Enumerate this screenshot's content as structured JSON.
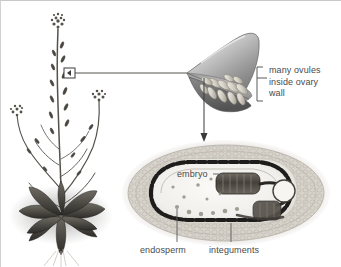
{
  "figure": {
    "background_color": "#ffffff",
    "text_color": "#4a4a4a",
    "border_color": "#c8c8c8"
  },
  "labels": {
    "many_ovules": "many ovules",
    "inside_ovary": "inside ovary",
    "wall": "wall",
    "embryo": "embryo",
    "endosperm": "endosperm",
    "integuments": "integuments"
  },
  "parts": {
    "plant": "arabidopsis-plant-photo",
    "callout_box": "stem-magnification-box",
    "connector_line": "callout-connector-line",
    "ovary": "ovary-cutaway-illustration",
    "ovules": "ovules-inside-ovary",
    "bracket": "ovule-label-bracket",
    "arrow": "ovary-to-seed-arrow",
    "seed": "seed-cross-section-micrograph",
    "embryo_structure": "embryo-in-seed",
    "endosperm_region": "endosperm-region",
    "integument_layers": "integument-layers"
  },
  "colors": {
    "ovary_wall_light": "#d8d8d8",
    "ovary_wall_mid": "#a8a8a8",
    "ovary_wall_dark": "#6e6e6e",
    "ovule_fill": "#dedad2",
    "seed_tissue": "#d9d6cf",
    "seed_dark": "#2a2a2a",
    "leader_line": "#5a5a5a"
  }
}
